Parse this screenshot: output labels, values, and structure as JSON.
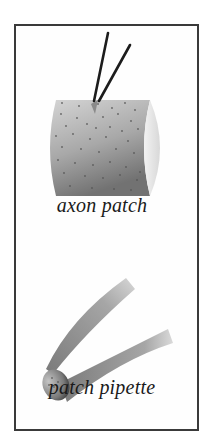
{
  "figure": {
    "panels": [
      {
        "id": "axon-patch",
        "label": "axon patch"
      },
      {
        "id": "patch-pipette",
        "label": "patch pipette"
      }
    ],
    "colors": {
      "border": "#3a3a3a",
      "ink": "#1a1a1a",
      "cylinder_dark": "#6e6e6e",
      "cylinder_light": "#e6e6e6",
      "pipette_gray": "#9a9a9a"
    }
  }
}
